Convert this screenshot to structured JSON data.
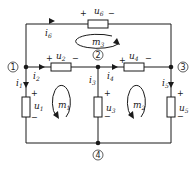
{
  "diagram": {
    "type": "circuit",
    "nodes": [
      {
        "id": "n1",
        "label": "1"
      },
      {
        "id": "n2",
        "label": "2"
      },
      {
        "id": "n3",
        "label": "3"
      },
      {
        "id": "n4",
        "label": "4"
      }
    ],
    "branches": [
      {
        "id": "b1",
        "voltage": "u",
        "vsub": "1",
        "current": "i",
        "isub": "1",
        "from": "n1",
        "to": "n4"
      },
      {
        "id": "b2",
        "voltage": "u",
        "vsub": "2",
        "current": "i",
        "isub": "2",
        "from": "n1",
        "to": "n2"
      },
      {
        "id": "b3",
        "voltage": "u",
        "vsub": "3",
        "current": "i",
        "isub": "3",
        "from": "n2",
        "to": "n4"
      },
      {
        "id": "b4",
        "voltage": "u",
        "vsub": "4",
        "current": "i",
        "isub": "4",
        "from": "n2",
        "to": "n3"
      },
      {
        "id": "b5",
        "voltage": "u",
        "vsub": "5",
        "current": "i",
        "isub": "5",
        "from": "n3",
        "to": "n4"
      },
      {
        "id": "b6",
        "voltage": "u",
        "vsub": "6",
        "current": "i",
        "isub": "6",
        "from": "n1",
        "to": "n3"
      }
    ],
    "meshes": [
      {
        "id": "m1",
        "label": "m",
        "sub": "1",
        "direction": "clockwise"
      },
      {
        "id": "m2",
        "label": "m",
        "sub": "2",
        "direction": "clockwise"
      },
      {
        "id": "m3",
        "label": "m",
        "sub": "3",
        "direction": "clockwise"
      }
    ],
    "signs": {
      "plus": "+",
      "minus": "−"
    }
  }
}
